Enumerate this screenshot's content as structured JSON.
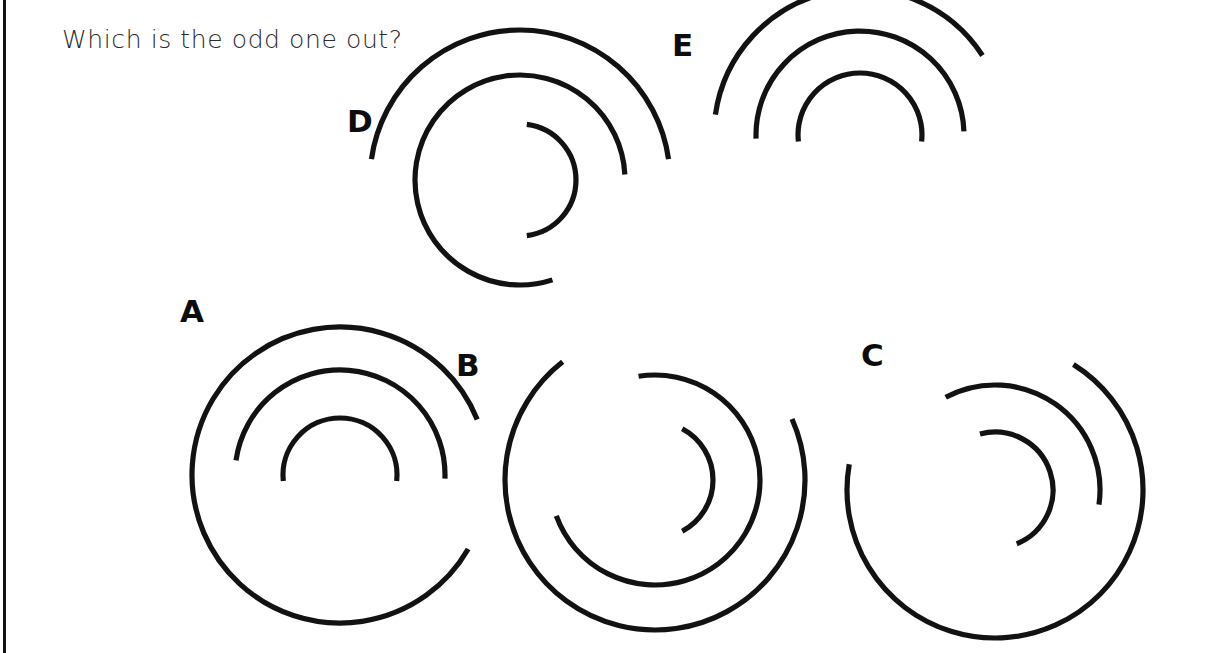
{
  "page": {
    "width": 1211,
    "height": 653,
    "background_color": "#ffffff",
    "stroke_color": "#121212",
    "left_border": {
      "x": 3,
      "width": 3,
      "color": "#121212"
    }
  },
  "question": {
    "text": "Which is the odd one out?",
    "x": 62,
    "y": 25,
    "color": "#2b2b2b"
  },
  "puzzle": {
    "type": "odd-one-out",
    "option_count": 5,
    "rings_per_figure": 3
  },
  "figures": [
    {
      "id": "A",
      "label": "A",
      "label_x": 180,
      "label_y": 296,
      "cx": 340,
      "cy": 475,
      "arcs": [
        {
          "name": "outer",
          "r": 148,
          "start_deg": 22,
          "end_deg": 330,
          "sweep": "ccw"
        },
        {
          "name": "middle",
          "r": 105,
          "start_deg": 172,
          "end_deg": 358,
          "sweep": "cw"
        },
        {
          "name": "inner",
          "r": 57,
          "start_deg": 186,
          "end_deg": 354,
          "sweep": "cw"
        }
      ]
    },
    {
      "id": "B",
      "label": "B",
      "label_x": 456,
      "label_y": 350,
      "cx": 655,
      "cy": 480,
      "arcs": [
        {
          "name": "outer",
          "r": 150,
          "start_deg": 128,
          "end_deg": 24,
          "sweep": "ccw"
        },
        {
          "name": "middle",
          "r": 105,
          "start_deg": 99,
          "end_deg": 200,
          "sweep": "cw"
        },
        {
          "name": "inner",
          "r": 58,
          "start_deg": 62,
          "end_deg": 298,
          "sweep": "cw"
        }
      ]
    },
    {
      "id": "C",
      "label": "C",
      "label_x": 861,
      "label_y": 340,
      "cx": 995,
      "cy": 490,
      "arcs": [
        {
          "name": "outer",
          "r": 148,
          "start_deg": 58,
          "end_deg": 170,
          "sweep": "cw"
        },
        {
          "name": "middle",
          "r": 105,
          "start_deg": 118,
          "end_deg": 352,
          "sweep": "cw"
        },
        {
          "name": "inner",
          "r": 58,
          "start_deg": 105,
          "end_deg": 292,
          "sweep": "cw"
        }
      ]
    },
    {
      "id": "D",
      "label": "D",
      "label_x": 347,
      "label_y": 106,
      "cx": 520,
      "cy": 180,
      "arcs": [
        {
          "name": "outer",
          "r": 150,
          "start_deg": 172,
          "end_deg": 8,
          "sweep": "cw"
        },
        {
          "name": "middle",
          "r": 105,
          "start_deg": 3,
          "end_deg": 288,
          "sweep": "ccw"
        },
        {
          "name": "inner",
          "r": 56,
          "start_deg": 83,
          "end_deg": 277,
          "sweep": "cw"
        }
      ]
    },
    {
      "id": "E",
      "label": "E",
      "label_x": 672,
      "label_y": 30,
      "cx": 860,
      "cy": 135,
      "arcs": [
        {
          "name": "outer",
          "r": 146,
          "start_deg": 172,
          "end_deg": 33,
          "sweep": "cw"
        },
        {
          "name": "middle",
          "r": 104,
          "start_deg": 182,
          "end_deg": 2,
          "sweep": "cw"
        },
        {
          "name": "inner",
          "r": 62,
          "start_deg": 186,
          "end_deg": 354,
          "sweep": "cw"
        }
      ]
    }
  ]
}
